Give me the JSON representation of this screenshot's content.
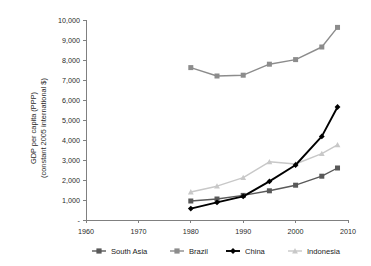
{
  "chart_data": {
    "type": "line",
    "title": "",
    "xlabel": "",
    "ylabel": "GDP per capita (PPP) (constant 2005 international $)",
    "ylabel_line1": "GDP per capita (PPP)",
    "ylabel_line2": "(constant 2005 international $)",
    "x": [
      1980,
      1985,
      1990,
      1995,
      2000,
      2005,
      2008
    ],
    "xlim": [
      1960,
      2010
    ],
    "ylim": [
      0,
      10000
    ],
    "xticks": [
      1960,
      1970,
      1980,
      1990,
      2000,
      2010
    ],
    "xtick_labels": [
      "1960",
      "1970",
      "1980",
      "1990",
      "2000",
      "2010"
    ],
    "yticks": [
      0,
      1000,
      2000,
      3000,
      4000,
      5000,
      6000,
      7000,
      8000,
      9000,
      10000
    ],
    "ytick_labels": [
      "-",
      "1,000",
      "2,000",
      "3,000",
      "4,000",
      "5,000",
      "6,000",
      "7,000",
      "8,000",
      "9,000",
      "10,000"
    ],
    "grid": false,
    "legend_position": "bottom",
    "series": [
      {
        "name": "South Asia",
        "color": "#595959",
        "marker": "square",
        "values": [
          950,
          1050,
          1230,
          1460,
          1740,
          2190,
          2600
        ]
      },
      {
        "name": "Brazil",
        "color": "#8c8c8c",
        "marker": "square",
        "values": [
          7620,
          7200,
          7240,
          7790,
          8020,
          8650,
          9630
        ]
      },
      {
        "name": "China",
        "color": "#000000",
        "marker": "diamond",
        "values": [
          570,
          880,
          1180,
          1930,
          2750,
          4180,
          5650
        ]
      },
      {
        "name": "Indonesia",
        "color": "#c8c8c8",
        "marker": "triangle",
        "values": [
          1400,
          1690,
          2120,
          2910,
          2800,
          3320,
          3760
        ]
      }
    ]
  },
  "legend": {
    "items": [
      {
        "label": "South Asia",
        "color": "#595959",
        "marker": "square"
      },
      {
        "label": "Brazil",
        "color": "#8c8c8c",
        "marker": "square"
      },
      {
        "label": "China",
        "color": "#000000",
        "marker": "diamond"
      },
      {
        "label": "Indonesia",
        "color": "#c8c8c8",
        "marker": "triangle"
      }
    ]
  }
}
